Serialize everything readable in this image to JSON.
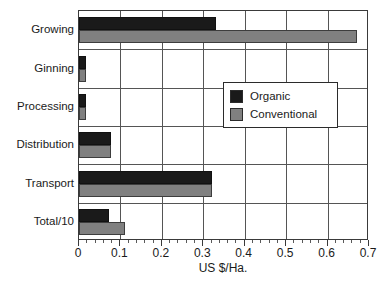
{
  "chart_data": {
    "type": "bar",
    "orientation": "horizontal",
    "title": "",
    "xlabel": "US $/Ha.",
    "ylabel": "",
    "xlim": [
      0,
      0.7
    ],
    "xticks": [
      "0",
      "0.1",
      "0.2",
      "0.3",
      "0.4",
      "0.5",
      "0.6",
      "0.7"
    ],
    "xtick_values": [
      0,
      0.1,
      0.2,
      0.3,
      0.4,
      0.5,
      0.6,
      0.7
    ],
    "minor_tick_step": 0.02,
    "grid": "both",
    "legend_position": "center-right-inside",
    "categories": [
      "Growing",
      "Ginning",
      "Processing",
      "Distribution",
      "Transport",
      "Total/10"
    ],
    "series": [
      {
        "name": "Organic",
        "color": "#1a1a1a",
        "values": [
          0.33,
          0.018,
          0.018,
          0.078,
          0.32,
          0.072
        ]
      },
      {
        "name": "Conventional",
        "color": "#808080",
        "values": [
          0.67,
          0.018,
          0.018,
          0.078,
          0.32,
          0.111
        ]
      }
    ]
  },
  "legend": {
    "items": [
      {
        "label": "Organic",
        "swatch": "organic"
      },
      {
        "label": "Conventional",
        "swatch": "conventional"
      }
    ]
  }
}
